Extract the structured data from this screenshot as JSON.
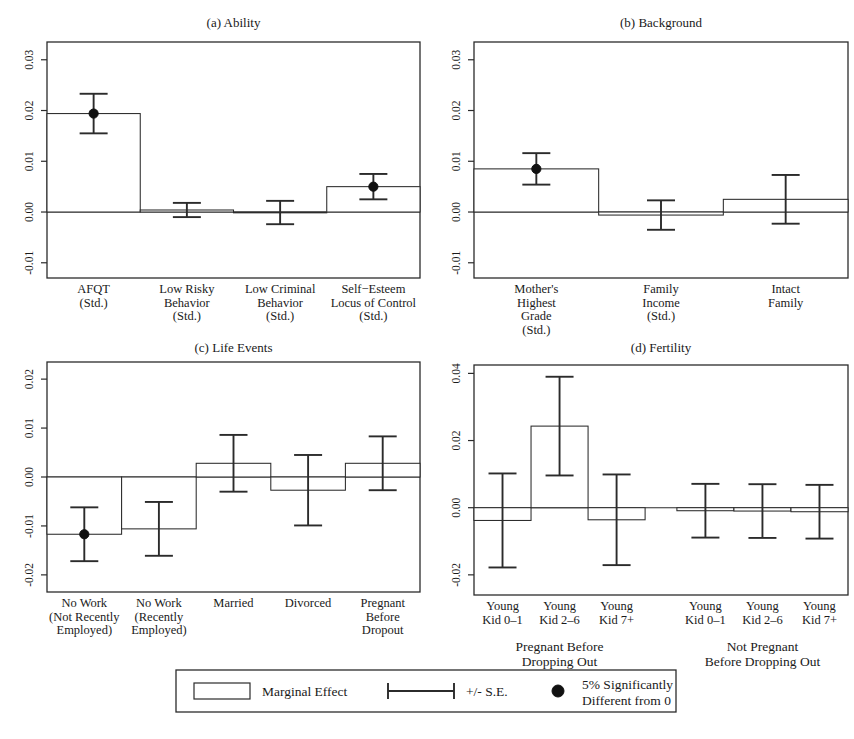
{
  "figure": {
    "width": 854,
    "height": 739,
    "bottom_artifact_text": ""
  },
  "legend": {
    "marginal_effect_label": "Marginal Effect",
    "se_label": "+/- S.E.",
    "significance_label_line1": "5% Significantly",
    "significance_label_line2": "Different from 0",
    "marginal_effect_icon": "open-rectangle-icon",
    "se_icon": "error-bar-icon",
    "significance_icon": "filled-circle-icon"
  },
  "chart_data": [
    {
      "type": "bar",
      "id": "panel-a",
      "title": "(a) Ability",
      "xlabel": "",
      "ylabel": "",
      "ylim": [
        -0.013,
        0.0335
      ],
      "yticks": [
        0.03,
        0.02,
        0.01,
        0.0,
        -0.01
      ],
      "ytick_labels": [
        "0.03",
        "0.02",
        "0.01",
        "0.00",
        "-0.01"
      ],
      "grid": false,
      "legend_position": "figure-bottom",
      "categories": [
        "AFQT\n(Std.)",
        "Low Risky\nBehavior\n(Std.)",
        "Low Criminal\nBehavior\n(Std.)",
        "Self-Esteem\nLocus of Control\n(Std.)"
      ],
      "category_lines": [
        [
          "AFQT",
          "(Std.)"
        ],
        [
          "Low Risky",
          "Behavior",
          "(Std.)"
        ],
        [
          "Low Criminal",
          "Behavior",
          "(Std.)"
        ],
        [
          "Self−Esteem",
          "Locus of Control",
          "(Std.)"
        ]
      ],
      "values": [
        0.0194,
        0.0004,
        -0.0001,
        0.005
      ],
      "errors": [
        0.0039,
        0.0014,
        0.0023,
        0.0025
      ],
      "significant": [
        true,
        false,
        false,
        true
      ]
    },
    {
      "type": "bar",
      "id": "panel-b",
      "title": "(b) Background",
      "xlabel": "",
      "ylabel": "",
      "ylim": [
        -0.013,
        0.0335
      ],
      "yticks": [
        0.03,
        0.02,
        0.01,
        0.0,
        -0.01
      ],
      "ytick_labels": [
        "0.03",
        "0.02",
        "0.01",
        "0.00",
        "-0.01"
      ],
      "grid": false,
      "legend_position": "figure-bottom",
      "categories": [
        "Mother's\nHighest\nGrade\n(Std.)",
        "Family\nIncome\n(Std.)",
        "Intact\nFamily"
      ],
      "category_lines": [
        [
          "Mother's",
          "Highest",
          "Grade",
          "(Std.)"
        ],
        [
          "Family",
          "Income",
          "(Std.)"
        ],
        [
          "Intact",
          "Family"
        ]
      ],
      "values": [
        0.0085,
        -0.0006,
        0.0025
      ],
      "errors": [
        0.0031,
        0.0029,
        0.0048
      ],
      "significant": [
        true,
        false,
        false
      ]
    },
    {
      "type": "bar",
      "id": "panel-c",
      "title": "(c) Life Events",
      "xlabel": "",
      "ylabel": "",
      "ylim": [
        -0.0235,
        0.0235
      ],
      "yticks": [
        0.02,
        0.01,
        0.0,
        -0.01,
        -0.02
      ],
      "ytick_labels": [
        "0.02",
        "0.01",
        "0.00",
        "-0.01",
        "-0.02"
      ],
      "grid": false,
      "legend_position": "figure-bottom",
      "categories": [
        "No Work\n(Not Recently\nEmployed)",
        "No Work\n(Recently\nEmployed)",
        "Married",
        "Divorced",
        "Pregnant\nBefore\nDropout"
      ],
      "category_lines": [
        [
          "No Work",
          "(Not Recently",
          "Employed)"
        ],
        [
          "No Work",
          "(Recently",
          "Employed)"
        ],
        [
          "Married"
        ],
        [
          "Divorced"
        ],
        [
          "Pregnant",
          "Before",
          "Dropout"
        ]
      ],
      "values": [
        -0.0117,
        -0.0106,
        0.0028,
        -0.0027,
        0.0028
      ],
      "errors": [
        0.0055,
        0.0055,
        0.0058,
        0.0072,
        0.0055
      ],
      "significant": [
        true,
        false,
        false,
        false,
        false
      ]
    },
    {
      "type": "bar",
      "id": "panel-d",
      "title": "(d) Fertility",
      "xlabel": "",
      "ylabel": "",
      "ylim": [
        -0.026,
        0.0425
      ],
      "yticks": [
        0.04,
        0.02,
        0.0,
        -0.02
      ],
      "ytick_labels": [
        "0.04",
        "0.02",
        "0.00",
        "-0.02"
      ],
      "grid": false,
      "legend_position": "figure-bottom",
      "categories": [
        "Young\nKid 0-1",
        "Young\nKid 2-6",
        "Young\nKid 7+",
        "Young\nKid 0-1",
        "Young\nKid 2-6",
        "Young\nKid 7+"
      ],
      "category_lines": [
        [
          "Young",
          "Kid 0–1"
        ],
        [
          "Young",
          "Kid 2–6"
        ],
        [
          "Young",
          "Kid 7+"
        ],
        [
          "Young",
          "Kid 0–1"
        ],
        [
          "Young",
          "Kid 2–6"
        ],
        [
          "Young",
          "Kid 7+"
        ]
      ],
      "values": [
        -0.0038,
        0.0243,
        -0.0036,
        -0.0009,
        -0.001,
        -0.0012
      ],
      "errors": [
        0.014,
        0.0147,
        0.0135,
        0.008,
        0.008,
        0.008
      ],
      "significant": [
        false,
        false,
        false,
        false,
        false,
        false
      ],
      "groups": [
        {
          "label_lines": [
            "Pregnant Before",
            "Dropping Out"
          ],
          "bar_indices": [
            0,
            1,
            2
          ]
        },
        {
          "label_lines": [
            "Not Pregnant",
            "Before Dropping Out"
          ],
          "bar_indices": [
            3,
            4,
            5
          ]
        }
      ]
    }
  ]
}
